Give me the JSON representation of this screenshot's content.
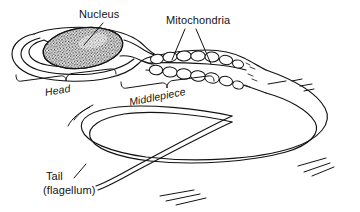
{
  "figure": {
    "style": "hand-drawn line art, black ink on white",
    "background_color": "#ffffff",
    "ink_color": "#131313",
    "width": 360,
    "height": 212
  },
  "labels": {
    "nucleus": "Nucleus",
    "mitochondria": "Mitochondria",
    "head": "Head",
    "middlepiece": "Middlepiece",
    "tail": "Tail",
    "flagellum": "(flagellum)"
  },
  "parts": [
    {
      "name": "nucleus",
      "label": "Nucleus",
      "description": "stippled dark ellipse inside the head",
      "leader_lines": 1
    },
    {
      "name": "mitochondria",
      "label": "Mitochondria",
      "description": "two rows of oval organelles wrapping the middlepiece",
      "leader_lines": 2,
      "count_upper_row": 6,
      "count_lower_row": 6
    },
    {
      "name": "head",
      "label": "Head",
      "description": "elongated oval anterior region containing the nucleus",
      "bracket": true
    },
    {
      "name": "middlepiece",
      "label": "Middlepiece",
      "description": "segment between head and tail packed with mitochondria",
      "bracket": true
    },
    {
      "name": "tail",
      "label": "Tail",
      "sublabel": "(flagellum)",
      "description": "long looping flagellum with motion lines",
      "leader_lines": 1
    }
  ],
  "icons": {
    "nucleus_leader": "leader-line",
    "mitochondria_leader_left": "leader-line",
    "mitochondria_leader_right": "leader-line",
    "tail_leader": "leader-line",
    "head_bracket": "curly-brace",
    "middlepiece_bracket": "curly-brace"
  }
}
